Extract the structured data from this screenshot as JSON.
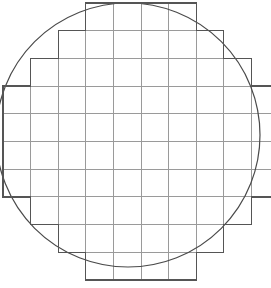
{
  "figure": {
    "name": "wafer-die-grid",
    "width": 271,
    "height": 288,
    "background_color": "#ffffff"
  },
  "colors": {
    "circle_stroke": "#4a4a4a",
    "grid_stroke": "#9a9a9a",
    "boundary_stroke": "#555555",
    "fill": "none"
  },
  "strokes": {
    "circle_width": 1.2,
    "grid_width": 1.0,
    "boundary_width": 1.3
  },
  "chart_data": {
    "type": "diagram",
    "title": "",
    "wafer_circle": {
      "center_x": 128,
      "center_y": 135,
      "radius": 132
    },
    "grid": {
      "columns": 10,
      "rows": 10,
      "cell_width": 27.6,
      "cell_height": 27.7,
      "origin_x": 3,
      "origin_y": 3,
      "x_lines": [
        3,
        30.6,
        58.2,
        85.8,
        113.4,
        141.0,
        168.6,
        196.2,
        223.8,
        251.4,
        279.0
      ],
      "y_lines": [
        3,
        30.7,
        58.4,
        86.1,
        113.8,
        141.5,
        169.2,
        196.9,
        224.6,
        252.3,
        280.0
      ]
    },
    "column_extent_rows": [
      {
        "column": 0,
        "row_start": 3,
        "row_end": 7
      },
      {
        "column": 1,
        "row_start": 2,
        "row_end": 8
      },
      {
        "column": 2,
        "row_start": 1,
        "row_end": 9
      },
      {
        "column": 3,
        "row_start": 0,
        "row_end": 10
      },
      {
        "column": 4,
        "row_start": 0,
        "row_end": 10
      },
      {
        "column": 5,
        "row_start": 0,
        "row_end": 10
      },
      {
        "column": 6,
        "row_start": 0,
        "row_end": 10
      },
      {
        "column": 7,
        "row_start": 1,
        "row_end": 9
      },
      {
        "column": 8,
        "row_start": 2,
        "row_end": 8
      },
      {
        "column": 9,
        "row_start": 3,
        "row_end": 7
      }
    ],
    "row_extent_columns": [
      {
        "row": 0,
        "col_start": 3,
        "col_end": 7
      },
      {
        "row": 1,
        "col_start": 2,
        "col_end": 8
      },
      {
        "row": 2,
        "col_start": 1,
        "col_end": 9
      },
      {
        "row": 3,
        "col_start": 0,
        "col_end": 10
      },
      {
        "row": 4,
        "col_start": 0,
        "col_end": 10
      },
      {
        "row": 5,
        "col_start": 0,
        "col_end": 10
      },
      {
        "row": 6,
        "col_start": 0,
        "col_end": 10
      },
      {
        "row": 7,
        "col_start": 1,
        "col_end": 9
      },
      {
        "row": 8,
        "col_start": 2,
        "col_end": 8
      },
      {
        "row": 9,
        "col_start": 3,
        "col_end": 7
      }
    ],
    "total_dies": 76
  },
  "elements": {
    "circle_label": "wafer-outline-circle",
    "grid_label": "die-grid",
    "boundary_label": "die-grid-staircase-boundary"
  }
}
